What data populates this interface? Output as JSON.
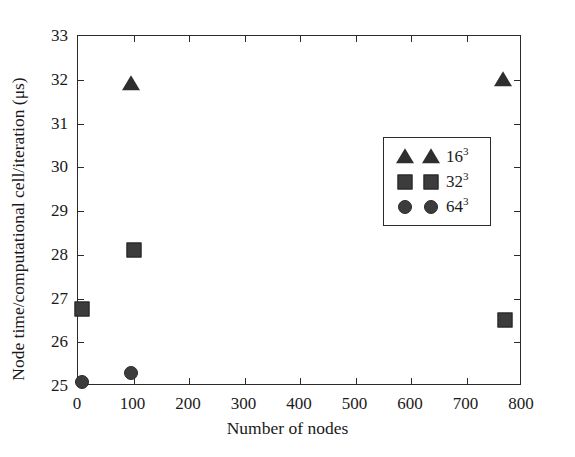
{
  "chart_data": {
    "type": "scatter",
    "title": "",
    "xlabel": "Number of nodes",
    "ylabel": "Node time/computational cell/iteration (μs)",
    "xlim": [
      0,
      800
    ],
    "ylim": [
      25,
      33
    ],
    "xticks": [
      0,
      100,
      200,
      300,
      400,
      500,
      600,
      700,
      800
    ],
    "xtick_labels": [
      "0",
      "100",
      "200",
      "300",
      "400",
      "500",
      "600",
      "700",
      "800"
    ],
    "yticks": [
      25,
      26,
      27,
      28,
      29,
      30,
      31,
      32,
      33
    ],
    "ytick_labels": [
      "25",
      "26",
      "27",
      "28",
      "29",
      "30",
      "31",
      "32",
      "33"
    ],
    "grid": false,
    "legend_position": "center-right",
    "marker_color": "#3c3c3c",
    "axis_color": "#2b2b2b",
    "series": [
      {
        "name": "16^3",
        "label_base": "16",
        "label_exponent": "3",
        "marker": "triangle",
        "points": [
          {
            "x": 95,
            "y": 31.9
          },
          {
            "x": 765,
            "y": 32.0
          }
        ]
      },
      {
        "name": "32^3",
        "label_base": "32",
        "label_exponent": "3",
        "marker": "square",
        "points": [
          {
            "x": 8,
            "y": 26.75
          },
          {
            "x": 100,
            "y": 28.1
          },
          {
            "x": 770,
            "y": 26.5
          }
        ]
      },
      {
        "name": "64^3",
        "label_base": "64",
        "label_exponent": "3",
        "marker": "circle",
        "points": [
          {
            "x": 8,
            "y": 25.1
          },
          {
            "x": 95,
            "y": 25.3
          }
        ]
      }
    ]
  }
}
